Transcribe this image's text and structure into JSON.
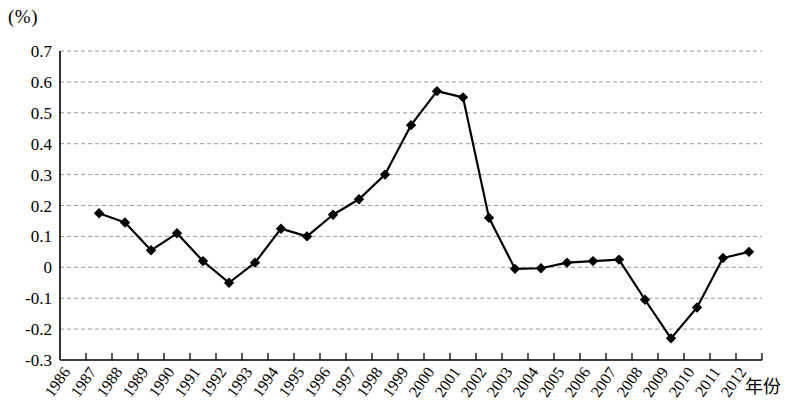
{
  "chart_data": {
    "type": "line",
    "title": "",
    "subtitle": "",
    "unit_label": "(%)",
    "xlabel": "年份",
    "ylabel": "",
    "ylim": [
      -0.3,
      0.7
    ],
    "yticks": [
      "0.7",
      "0.6",
      "0.5",
      "0.4",
      "0.3",
      "0.2",
      "0.1",
      "0",
      "-0.1",
      "-0.2",
      "-0.3"
    ],
    "ytick_values": [
      0.7,
      0.6,
      0.5,
      0.4,
      0.3,
      0.2,
      0.1,
      0,
      -0.1,
      -0.2,
      -0.3
    ],
    "grid": true,
    "grid_style": "dashed-horizontal",
    "legend": "none",
    "marker": "diamond",
    "series_color": "#000000",
    "categories": [
      "1986",
      "1987",
      "1988",
      "1989",
      "1990",
      "1991",
      "1992",
      "1993",
      "1994",
      "1995",
      "1996",
      "1997",
      "1998",
      "1999",
      "2000",
      "2001",
      "2002",
      "2003",
      "2004",
      "2005",
      "2006",
      "2007",
      "2008",
      "2009",
      "2010",
      "2011",
      "2012"
    ],
    "series": [
      {
        "name": "",
        "x": [
          "1987",
          "1988",
          "1989",
          "1990",
          "1991",
          "1992",
          "1993",
          "1994",
          "1995",
          "1996",
          "1997",
          "1998",
          "1999",
          "2000",
          "2001",
          "2002",
          "2003",
          "2004",
          "2005",
          "2006",
          "2007",
          "2008",
          "2009",
          "2010",
          "2011",
          "2012"
        ],
        "values": [
          0.175,
          0.145,
          0.055,
          0.11,
          0.02,
          -0.05,
          0.015,
          0.125,
          0.1,
          0.17,
          0.22,
          0.3,
          0.46,
          0.57,
          0.55,
          0.16,
          -0.005,
          -0.003,
          0.015,
          0.02,
          0.025,
          -0.105,
          -0.23,
          -0.13,
          0.03,
          0.05
        ]
      }
    ],
    "last_value": -0.03
  }
}
